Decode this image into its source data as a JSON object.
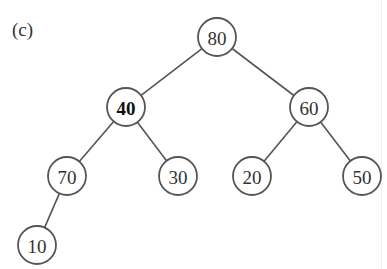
{
  "figure_label": "(c)",
  "tree": {
    "nodes": [
      {
        "id": "n80",
        "value": "80",
        "x": 217,
        "y": 37,
        "bold": false
      },
      {
        "id": "n40",
        "value": "40",
        "x": 126,
        "y": 107,
        "bold": true
      },
      {
        "id": "n60",
        "value": "60",
        "x": 309,
        "y": 107,
        "bold": false
      },
      {
        "id": "n70",
        "value": "70",
        "x": 67,
        "y": 176,
        "bold": false
      },
      {
        "id": "n30",
        "value": "30",
        "x": 178,
        "y": 176,
        "bold": false
      },
      {
        "id": "n20",
        "value": "20",
        "x": 252,
        "y": 176,
        "bold": false
      },
      {
        "id": "n50",
        "value": "50",
        "x": 362,
        "y": 176,
        "bold": false
      },
      {
        "id": "n10",
        "value": "10",
        "x": 37,
        "y": 245,
        "bold": false
      }
    ],
    "edges": [
      [
        "n80",
        "n40"
      ],
      [
        "n80",
        "n60"
      ],
      [
        "n40",
        "n70"
      ],
      [
        "n40",
        "n30"
      ],
      [
        "n60",
        "n20"
      ],
      [
        "n60",
        "n50"
      ],
      [
        "n70",
        "n10"
      ]
    ],
    "node_radius": 19
  }
}
